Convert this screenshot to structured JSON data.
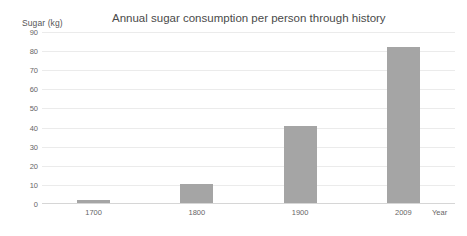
{
  "chart_data": {
    "type": "bar",
    "title": "Annual sugar consumption per person through history",
    "xlabel": "Year",
    "ylabel": "Sugar (kg)",
    "categories": [
      "1700",
      "1800",
      "1900",
      "2009"
    ],
    "values": [
      2,
      10.5,
      41,
      82
    ],
    "series": [
      {
        "name": "Sugar (kg)",
        "values": [
          2,
          10.5,
          41,
          82
        ]
      }
    ],
    "ylim": [
      0,
      90
    ],
    "ytick_labels": [
      "90",
      "80",
      "70",
      "60",
      "50",
      "40",
      "30",
      "20",
      "10",
      "0"
    ],
    "ytick_values": [
      90,
      80,
      70,
      60,
      50,
      40,
      30,
      20,
      10,
      0
    ],
    "grid": true,
    "legend": false,
    "bar_color": "#a5a5a5",
    "gridline_color": "#ebebeb",
    "axis_color": "#d6d6d6",
    "background_color": "#ffffff"
  }
}
